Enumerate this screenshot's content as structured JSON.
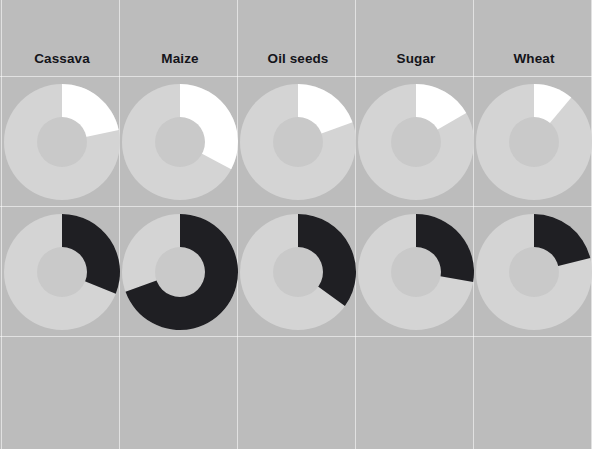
{
  "figure": {
    "title": "",
    "background_color": "#bcbcbc",
    "gridline_color": "#ffffff"
  },
  "columns": [
    {
      "label": "Cassava"
    },
    {
      "label": "Maize"
    },
    {
      "label": "Oil seeds"
    },
    {
      "label": "Sugar"
    },
    {
      "label": "Wheat"
    }
  ],
  "chart_data": {
    "type": "pie",
    "title": "",
    "xlabel": "",
    "ylabel": "",
    "legend": [],
    "grid": true,
    "layout": {
      "rows": 3,
      "cols": 5,
      "row_labels": [
        "row-1",
        "row-2",
        "row-3"
      ],
      "col_labels": [
        "Cassava",
        "Maize",
        "Oil seeds",
        "Sugar",
        "Wheat"
      ]
    },
    "colors": {
      "wedge_row1": "#ffffff",
      "wedge_row2": "#1f1f23",
      "pie_body": "#d4d4d4",
      "inner_hole": "#c9c9c9",
      "background": "#bcbcbc"
    },
    "panels": [
      {
        "row": 1,
        "column": "Cassava",
        "highlight_color": "#ffffff",
        "start_angle_deg": 0,
        "end_angle_deg": 78,
        "share_percent": 21.7,
        "values": [
          21.7,
          78.3
        ]
      },
      {
        "row": 1,
        "column": "Maize",
        "highlight_color": "#ffffff",
        "start_angle_deg": 0,
        "end_angle_deg": 118,
        "share_percent": 32.8,
        "values": [
          32.8,
          67.2
        ]
      },
      {
        "row": 1,
        "column": "Oil seeds",
        "highlight_color": "#ffffff",
        "start_angle_deg": 0,
        "end_angle_deg": 70,
        "share_percent": 19.4,
        "values": [
          19.4,
          80.6
        ]
      },
      {
        "row": 1,
        "column": "Sugar",
        "highlight_color": "#ffffff",
        "start_angle_deg": 0,
        "end_angle_deg": 60,
        "share_percent": 16.7,
        "values": [
          16.7,
          83.3
        ]
      },
      {
        "row": 1,
        "column": "Wheat",
        "highlight_color": "#ffffff",
        "start_angle_deg": 0,
        "end_angle_deg": 40,
        "share_percent": 11.1,
        "values": [
          11.1,
          88.9
        ]
      },
      {
        "row": 2,
        "column": "Cassava",
        "highlight_color": "#1f1f23",
        "start_angle_deg": 0,
        "end_angle_deg": 112,
        "share_percent": 31.1,
        "values": [
          31.1,
          68.9
        ]
      },
      {
        "row": 2,
        "column": "Maize",
        "highlight_color": "#1f1f23",
        "start_angle_deg": 0,
        "end_angle_deg": 250,
        "share_percent": 69.4,
        "values": [
          69.4,
          30.6
        ]
      },
      {
        "row": 2,
        "column": "Oil seeds",
        "highlight_color": "#1f1f23",
        "start_angle_deg": 0,
        "end_angle_deg": 126,
        "share_percent": 35.0,
        "values": [
          35.0,
          65.0
        ]
      },
      {
        "row": 2,
        "column": "Sugar",
        "highlight_color": "#1f1f23",
        "start_angle_deg": 0,
        "end_angle_deg": 100,
        "share_percent": 27.8,
        "values": [
          27.8,
          72.2
        ]
      },
      {
        "row": 2,
        "column": "Wheat",
        "highlight_color": "#1f1f23",
        "start_angle_deg": 0,
        "end_angle_deg": 76,
        "share_percent": 21.1,
        "values": [
          21.1,
          78.9
        ]
      },
      {
        "row": 3,
        "column": "Cassava",
        "highlight_color": "",
        "start_angle_deg": 0,
        "end_angle_deg": 0,
        "share_percent": 0,
        "values": []
      },
      {
        "row": 3,
        "column": "Maize",
        "highlight_color": "",
        "start_angle_deg": 0,
        "end_angle_deg": 0,
        "share_percent": 0,
        "values": []
      },
      {
        "row": 3,
        "column": "Oil seeds",
        "highlight_color": "",
        "start_angle_deg": 0,
        "end_angle_deg": 0,
        "share_percent": 0,
        "values": []
      },
      {
        "row": 3,
        "column": "Sugar",
        "highlight_color": "",
        "start_angle_deg": 0,
        "end_angle_deg": 0,
        "share_percent": 0,
        "values": []
      },
      {
        "row": 3,
        "column": "Wheat",
        "highlight_color": "",
        "start_angle_deg": 0,
        "end_angle_deg": 0,
        "share_percent": 0,
        "values": []
      }
    ],
    "geometry": {
      "col_x": [
        3,
        121,
        239,
        357,
        475
      ],
      "col_width": 118,
      "header_height": 76,
      "row_tops": [
        76,
        206,
        336
      ],
      "row_height": 130,
      "pie_center_x": 59,
      "pie_center_y": 66,
      "pie_radius": 58,
      "hole_radius": 25
    }
  }
}
